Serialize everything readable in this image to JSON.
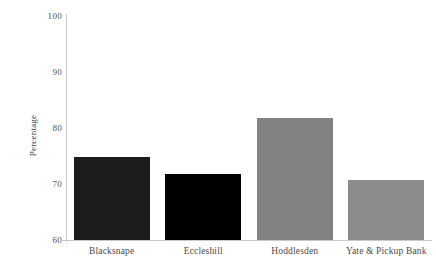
{
  "chart_data": {
    "type": "bar",
    "title": "",
    "subtitle": "",
    "xlabel": "",
    "ylabel": "Percentage",
    "categories": [
      "Blacksnape",
      "Eccleshill",
      "Hoddlesden",
      "Yate & Pickup Bank"
    ],
    "values": [
      74.8,
      71.7,
      81.7,
      70.8
    ],
    "bar_colors": [
      "#1c1c1c",
      "#000000",
      "#828282",
      "#8c8c8c"
    ],
    "ylim": [
      60,
      100
    ],
    "yticks": [
      100,
      90,
      80,
      70,
      60
    ],
    "ytick_labels": [
      "100",
      "90",
      "80",
      "70",
      "60"
    ],
    "grid": false,
    "legend": false,
    "legend_position": "none",
    "axis_color": "#c9c9c9",
    "text_color": "#4a4a4a"
  }
}
